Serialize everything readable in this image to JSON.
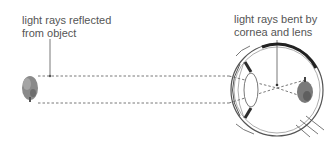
{
  "diagram": {
    "labels": {
      "reflected": {
        "line1": "light rays reflected",
        "line2": "from object"
      },
      "bent": {
        "line1": "light rays bent by",
        "line2": "cornea and lens"
      }
    },
    "elements": {
      "object": "tree",
      "image": "inverted tree on retina",
      "eye_parts": [
        "cornea",
        "lens",
        "iris",
        "retina",
        "optic nerve",
        "eyelids"
      ]
    },
    "colors": {
      "line": "#555555",
      "text": "#555555",
      "tree": "#8a8a8a",
      "iris": "#3a3a3a"
    }
  }
}
